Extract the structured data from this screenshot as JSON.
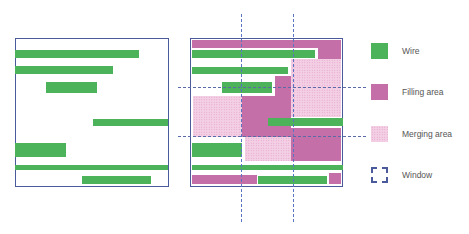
{
  "colors": {
    "wire": "#4cb35a",
    "filling": "#c56fa8",
    "merging": "#f3cfe4",
    "window": "#4a5a9a",
    "border": "#4a5a9a"
  },
  "legend": {
    "items": [
      {
        "key": "wire",
        "label": "Wire"
      },
      {
        "key": "filling",
        "label": "Filling area"
      },
      {
        "key": "merging",
        "label": "Merging area"
      },
      {
        "key": "window",
        "label": "Window"
      }
    ]
  },
  "left_panel": {
    "box": {
      "x": 15,
      "y": 38,
      "w": 154,
      "h": 149
    },
    "wires": [
      {
        "x": 15,
        "y": 50,
        "w": 124,
        "h": 8
      },
      {
        "x": 15,
        "y": 66,
        "w": 98,
        "h": 8
      },
      {
        "x": 46,
        "y": 82,
        "w": 51,
        "h": 11
      },
      {
        "x": 93,
        "y": 119,
        "w": 75,
        "h": 7
      },
      {
        "x": 15,
        "y": 143,
        "w": 51,
        "h": 14
      },
      {
        "x": 15,
        "y": 165,
        "w": 153,
        "h": 5
      },
      {
        "x": 82,
        "y": 176,
        "w": 69,
        "h": 8
      }
    ]
  },
  "right_panel": {
    "box": {
      "x": 190,
      "y": 38,
      "w": 153,
      "h": 149
    },
    "fills": [
      {
        "x": 192,
        "y": 40,
        "w": 149,
        "h": 8
      },
      {
        "x": 318,
        "y": 48,
        "w": 23,
        "h": 11
      },
      {
        "x": 275,
        "y": 76,
        "w": 16,
        "h": 21
      },
      {
        "x": 242,
        "y": 96,
        "w": 49,
        "h": 41
      },
      {
        "x": 291,
        "y": 128,
        "w": 50,
        "h": 33
      },
      {
        "x": 192,
        "y": 175,
        "w": 65,
        "h": 9
      },
      {
        "x": 329,
        "y": 173,
        "w": 12,
        "h": 11
      }
    ],
    "merges": [
      {
        "x": 291,
        "y": 59,
        "w": 50,
        "h": 58
      },
      {
        "x": 193,
        "y": 96,
        "w": 49,
        "h": 41
      },
      {
        "x": 245,
        "y": 137,
        "w": 46,
        "h": 24
      }
    ],
    "wires": [
      {
        "x": 192,
        "y": 50,
        "w": 123,
        "h": 8
      },
      {
        "x": 192,
        "y": 67,
        "w": 96,
        "h": 7
      },
      {
        "x": 222,
        "y": 82,
        "w": 50,
        "h": 11
      },
      {
        "x": 268,
        "y": 118,
        "w": 75,
        "h": 8
      },
      {
        "x": 192,
        "y": 143,
        "w": 50,
        "h": 14
      },
      {
        "x": 192,
        "y": 165,
        "w": 151,
        "h": 5
      },
      {
        "x": 258,
        "y": 176,
        "w": 69,
        "h": 8
      }
    ],
    "window_lines": {
      "vertical": [
        {
          "x": 241,
          "y1": 14,
          "y2": 222
        },
        {
          "x": 293,
          "y1": 14,
          "y2": 222
        }
      ],
      "horizontal": [
        {
          "y": 87,
          "x1": 178,
          "x2": 366
        },
        {
          "y": 136,
          "x1": 178,
          "x2": 366
        }
      ]
    }
  }
}
